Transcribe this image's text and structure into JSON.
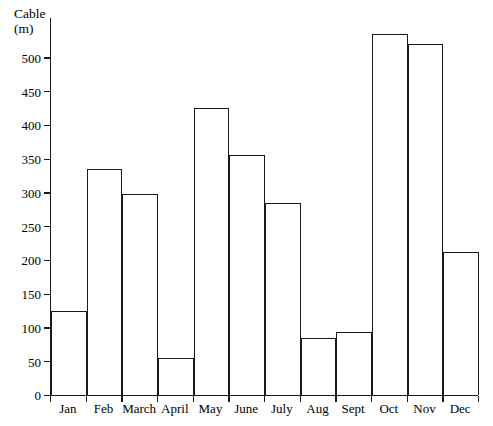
{
  "chart_data": {
    "type": "bar",
    "title": "",
    "ylabel": "Cable\n(m)",
    "xlabel": "",
    "categories": [
      "Jan",
      "Feb",
      "March",
      "April",
      "May",
      "June",
      "July",
      "Aug",
      "Sept",
      "Oct",
      "Nov",
      "Dec"
    ],
    "values": [
      125,
      335,
      298,
      55,
      425,
      355,
      285,
      85,
      93,
      535,
      520,
      212
    ],
    "ylim": [
      0,
      560
    ],
    "yticks": [
      0,
      50,
      100,
      150,
      200,
      250,
      300,
      350,
      400,
      450,
      500
    ],
    "ytick_labels": [
      "0",
      "50",
      "100",
      "150",
      "200",
      "250",
      "300",
      "350",
      "400",
      "450",
      "500"
    ],
    "grid": false,
    "legend": null,
    "bar_fill_color": "#ffffff",
    "bar_edge_color": "#1a1a1a",
    "axis_color": "#1a1a1a",
    "background_color": "#ffffff"
  }
}
